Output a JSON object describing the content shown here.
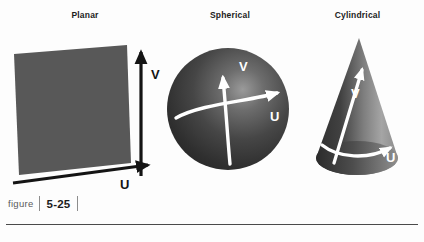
{
  "figure": {
    "caption_word": "figure",
    "caption_number": "5-25",
    "panels": [
      {
        "id": "planar",
        "title": "Planar",
        "shape": "quadrilateral",
        "fill_color": "#585858",
        "axis_color": "#141414",
        "axes": [
          {
            "name": "u-axis",
            "label": "U",
            "orientation": "horizontal-right"
          },
          {
            "name": "v-axis",
            "label": "V",
            "orientation": "vertical-up"
          }
        ]
      },
      {
        "id": "spherical",
        "title": "Spherical",
        "shape": "sphere",
        "fill_color": "#3a3a3a",
        "highlight_color": "#b9b9b9",
        "axis_color": "#ffffff",
        "axes": [
          {
            "name": "u-axis",
            "label": "U",
            "orientation": "curved-right"
          },
          {
            "name": "v-axis",
            "label": "V",
            "orientation": "curved-up"
          }
        ]
      },
      {
        "id": "cylindrical",
        "title": "Cylindrical",
        "shape": "cone",
        "fill_color_dark": "#3d3d3d",
        "fill_color_light": "#a8a8a8",
        "axis_color": "#ffffff",
        "axes": [
          {
            "name": "u-axis",
            "label": "U",
            "orientation": "curved-right"
          },
          {
            "name": "v-axis",
            "label": "V",
            "orientation": "up-right"
          }
        ]
      }
    ]
  }
}
